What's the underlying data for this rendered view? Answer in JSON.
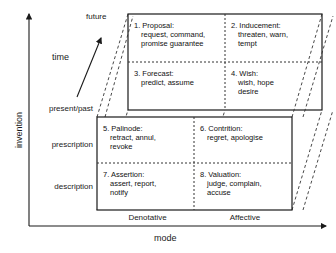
{
  "diagram": {
    "title": "",
    "axes": {
      "y_title": "invention",
      "x_title": "mode",
      "depth_title": "time",
      "y_ticks": [
        "present/past",
        "prescription",
        "description"
      ],
      "x_ticks": [
        "Denotative",
        "Affective"
      ],
      "depth_ticks": [
        "future",
        "present/past"
      ]
    },
    "colors": {
      "line": "#1a1a1a",
      "dashed": "#333333",
      "text": "#1a1a1a",
      "background": "#ffffff"
    },
    "front_face": {
      "cells": [
        {
          "number": "5.",
          "head": "5. Palinode:",
          "items": [
            "retract, annul,",
            "revoke"
          ]
        },
        {
          "number": "6.",
          "head": "6. Contrition:",
          "items": [
            "regret, apologise"
          ]
        },
        {
          "number": "7.",
          "head": "7. Assertion:",
          "items": [
            "assert, report,",
            "notify"
          ]
        },
        {
          "number": "8.",
          "head": "8. Valuation:",
          "items": [
            "judge, complain,",
            "accuse"
          ]
        }
      ]
    },
    "back_face": {
      "cells": [
        {
          "number": "1.",
          "head": "1. Proposal:",
          "items": [
            "request, command,",
            "promise guarantee"
          ]
        },
        {
          "number": "2.",
          "head": "2. Inducement:",
          "items": [
            "threaten, warn,",
            "tempt"
          ]
        },
        {
          "number": "3.",
          "head": "3. Forecast:",
          "items": [
            "predict, assume"
          ]
        },
        {
          "number": "4.",
          "head": "4. Wish:",
          "items": [
            "wish, hope",
            "desire"
          ]
        }
      ]
    }
  }
}
